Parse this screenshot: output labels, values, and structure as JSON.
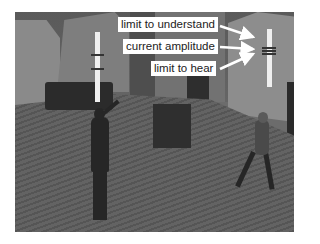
{
  "scene": {
    "description": "Grayscale 3D virtual world with two avatars, a couch, a box and two sound-level poles",
    "annotations": [
      {
        "id": "understand",
        "label": "limit to understand"
      },
      {
        "id": "amplitude",
        "label": "current amplitude"
      },
      {
        "id": "hear",
        "label": "limit to hear"
      }
    ],
    "colors": {
      "label_bg": "#ffffff",
      "label_text": "#222222",
      "arrow": "#ffffff",
      "pole": "#efefef"
    }
  }
}
